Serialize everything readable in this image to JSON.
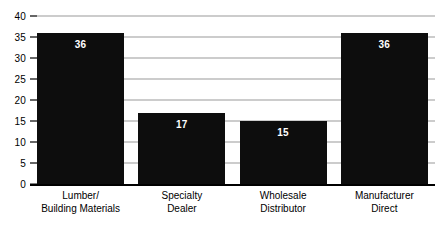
{
  "chart_data": {
    "type": "bar",
    "title": "",
    "xlabel": "",
    "ylabel": "",
    "categories": [
      "Lumber/ Building Materials",
      "Specialty Dealer",
      "Wholesale Distributor",
      "Manufacturer Direct"
    ],
    "category_lines": [
      [
        "Lumber/",
        "Building Materials"
      ],
      [
        "Specialty",
        "Dealer"
      ],
      [
        "Wholesale",
        "Distributor"
      ],
      [
        "Manufacturer",
        "Direct"
      ]
    ],
    "values": [
      36,
      17,
      15,
      36
    ],
    "value_labels": [
      "36",
      "17",
      "15",
      "36"
    ],
    "ylim": [
      0,
      40
    ],
    "yticks": [
      0,
      5,
      10,
      15,
      20,
      25,
      30,
      35,
      40
    ],
    "ytick_labels": [
      "0",
      "5",
      "10",
      "15",
      "20",
      "25",
      "30",
      "35",
      "40"
    ],
    "grid": true,
    "legend": "none",
    "bar_color": "#0d0d0d",
    "gridline_color": "#9a9a9a",
    "axis_color": "#000000",
    "value_label_color": "#ffffff",
    "background_color": "#ffffff"
  }
}
